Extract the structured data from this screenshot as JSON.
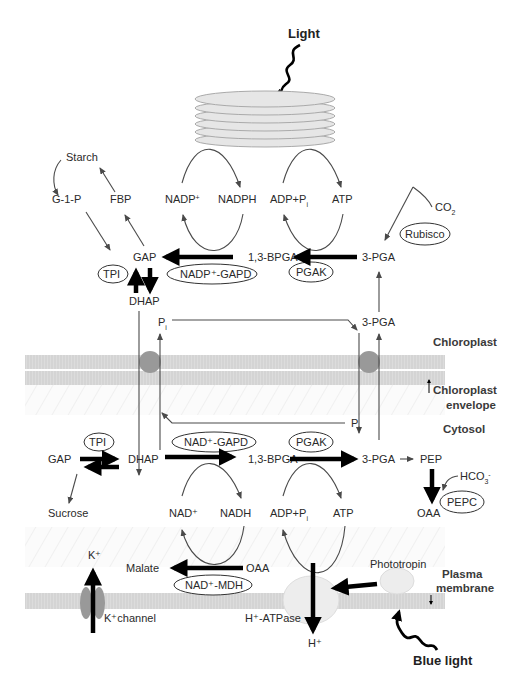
{
  "light_sources": {
    "light": "Light",
    "blue_light": "Blue light"
  },
  "compartments": {
    "chloroplast": "Chloroplast",
    "chloroplast_envelope_1": "Chloroplast",
    "chloroplast_envelope_2": "envelope",
    "cytosol": "Cytosol",
    "plasma_membrane_1": "Plasma",
    "plasma_membrane_2": "membrane"
  },
  "chloroplast": {
    "starch": "Starch",
    "g1p": "G-1-P",
    "fbp": "FBP",
    "nadp_plus": "NADP",
    "nadph": "NADPH",
    "adp_pi": "ADP+P",
    "atp": "ATP",
    "co2": "CO",
    "co2_sub": "2",
    "gap": "GAP",
    "bpga": "1,3-BPGA",
    "pga": "3-PGA",
    "dhap": "DHAP",
    "pi": "P",
    "pi_sub": "i",
    "pga_transport": "3-PGA",
    "enzymes": {
      "tpi": "TPI",
      "nadp_gapd": "NADP⁺-GAPD",
      "pgak": "PGAK",
      "rubisco": "Rubisco"
    }
  },
  "cytosol": {
    "pi": "P",
    "pi_sub": "i",
    "gap": "GAP",
    "dhap": "DHAP",
    "bpga": "1,3-BPGA",
    "pga": "3-PGA",
    "pep": "PEP",
    "hco3": "HCO",
    "hco3_sub": "3",
    "hco3_sup": "-",
    "oaa_pepc": "OAA",
    "sucrose": "Sucrose",
    "nad_plus": "NAD⁺",
    "nadh": "NADH",
    "adp_pi": "ADP+P",
    "atp": "ATP",
    "malate": "Malate",
    "oaa": "OAA",
    "enzymes": {
      "tpi": "TPI",
      "nad_gapd": "NAD⁺-GAPD",
      "pgak": "PGAK",
      "pepc": "PEPC",
      "nad_mdh": "NAD⁺-MDH"
    }
  },
  "membrane_proteins": {
    "k_plus": "K⁺",
    "k_channel": "K⁺channel",
    "h_atpase": "H⁺-ATPase",
    "h_plus": "H⁺",
    "phototropin": "Phototropin"
  },
  "colors": {
    "membrane": "#d9d9d9",
    "transporter": "#999999",
    "thylakoid": "#e6e6e6",
    "arrow_thick": "#000000",
    "arrow_thin": "#4a4a4a"
  }
}
